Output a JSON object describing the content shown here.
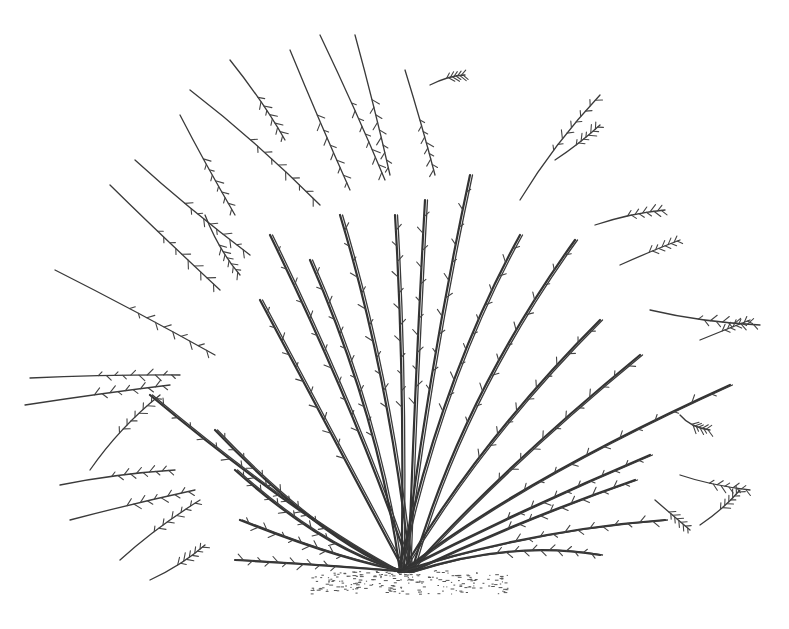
{
  "illustration": {
    "subject": "shrub line drawing",
    "style": "pen-and-ink botanical",
    "ink_color": "#333333",
    "background_color": "#ffffff",
    "base": {
      "x": 405,
      "y": 572
    },
    "stems": [
      {
        "to": [
          150,
          395
        ],
        "c": [
          300,
          520
        ]
      },
      {
        "to": [
          215,
          430
        ],
        "c": [
          320,
          540
        ]
      },
      {
        "to": [
          235,
          470
        ],
        "c": [
          330,
          555
        ]
      },
      {
        "to": [
          240,
          520
        ],
        "c": [
          340,
          560
        ]
      },
      {
        "to": [
          235,
          560
        ],
        "c": [
          330,
          565
        ]
      },
      {
        "to": [
          260,
          300
        ],
        "c": [
          340,
          450
        ]
      },
      {
        "to": [
          270,
          235
        ],
        "c": [
          360,
          420
        ]
      },
      {
        "to": [
          310,
          260
        ],
        "c": [
          380,
          420
        ]
      },
      {
        "to": [
          340,
          215
        ],
        "c": [
          390,
          380
        ]
      },
      {
        "to": [
          395,
          215
        ],
        "c": [
          405,
          380
        ]
      },
      {
        "to": [
          425,
          200
        ],
        "c": [
          415,
          380
        ]
      },
      {
        "to": [
          470,
          175
        ],
        "c": [
          430,
          360
        ]
      },
      {
        "to": [
          520,
          235
        ],
        "c": [
          440,
          380
        ]
      },
      {
        "to": [
          575,
          240
        ],
        "c": [
          460,
          400
        ]
      },
      {
        "to": [
          600,
          320
        ],
        "c": [
          480,
          440
        ]
      },
      {
        "to": [
          640,
          355
        ],
        "c": [
          500,
          470
        ]
      },
      {
        "to": [
          730,
          385
        ],
        "c": [
          520,
          480
        ]
      },
      {
        "to": [
          650,
          455
        ],
        "c": [
          520,
          510
        ]
      },
      {
        "to": [
          635,
          480
        ],
        "c": [
          520,
          520
        ]
      },
      {
        "to": [
          600,
          555
        ],
        "c": [
          510,
          540
        ]
      },
      {
        "to": [
          665,
          520
        ],
        "c": [
          530,
          530
        ]
      }
    ],
    "loose_sprigs": [
      [
        [
          190,
          90
        ],
        [
          320,
          205
        ]
      ],
      [
        [
          230,
          60
        ],
        [
          285,
          140
        ]
      ],
      [
        [
          290,
          50
        ],
        [
          350,
          190
        ]
      ],
      [
        [
          320,
          35
        ],
        [
          385,
          180
        ]
      ],
      [
        [
          355,
          35
        ],
        [
          390,
          175
        ]
      ],
      [
        [
          405,
          70
        ],
        [
          435,
          175
        ]
      ],
      [
        [
          430,
          85
        ],
        [
          465,
          75
        ]
      ],
      [
        [
          520,
          200
        ],
        [
          600,
          95
        ]
      ],
      [
        [
          555,
          160
        ],
        [
          600,
          125
        ]
      ],
      [
        [
          110,
          185
        ],
        [
          220,
          290
        ]
      ],
      [
        [
          135,
          160
        ],
        [
          250,
          255
        ]
      ],
      [
        [
          180,
          115
        ],
        [
          235,
          215
        ]
      ],
      [
        [
          205,
          215
        ],
        [
          240,
          275
        ]
      ],
      [
        [
          55,
          270
        ],
        [
          215,
          355
        ]
      ],
      [
        [
          30,
          378
        ],
        [
          180,
          375
        ]
      ],
      [
        [
          25,
          405
        ],
        [
          170,
          385
        ]
      ],
      [
        [
          90,
          470
        ],
        [
          160,
          395
        ]
      ],
      [
        [
          60,
          485
        ],
        [
          175,
          470
        ]
      ],
      [
        [
          70,
          520
        ],
        [
          195,
          490
        ]
      ],
      [
        [
          120,
          560
        ],
        [
          200,
          500
        ]
      ],
      [
        [
          150,
          580
        ],
        [
          205,
          545
        ]
      ],
      [
        [
          595,
          225
        ],
        [
          665,
          210
        ]
      ],
      [
        [
          620,
          265
        ],
        [
          680,
          240
        ]
      ],
      [
        [
          650,
          310
        ],
        [
          760,
          325
        ]
      ],
      [
        [
          700,
          340
        ],
        [
          750,
          320
        ]
      ],
      [
        [
          680,
          415
        ],
        [
          710,
          430
        ]
      ],
      [
        [
          680,
          475
        ],
        [
          750,
          490
        ]
      ],
      [
        [
          700,
          525
        ],
        [
          740,
          490
        ]
      ],
      [
        [
          655,
          500
        ],
        [
          690,
          530
        ]
      ]
    ]
  }
}
